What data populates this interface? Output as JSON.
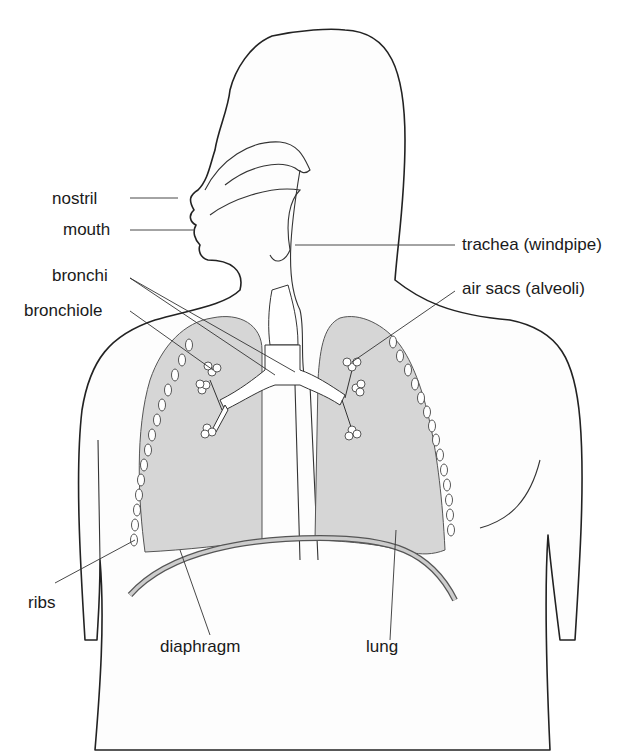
{
  "diagram": {
    "labels": {
      "nostril": "nostril",
      "mouth": "mouth",
      "bronchi": "bronchi",
      "bronchiole": "bronchiole",
      "trachea": "trachea (windpipe)",
      "air_sacs": "air sacs (alveoli)",
      "ribs": "ribs",
      "diaphragm": "diaphragm",
      "lung": "lung"
    },
    "colors": {
      "background": "#ffffff",
      "body_fill": "#fdfdfd",
      "lung_fill": "#d6d6d6",
      "line": "#222222"
    }
  }
}
